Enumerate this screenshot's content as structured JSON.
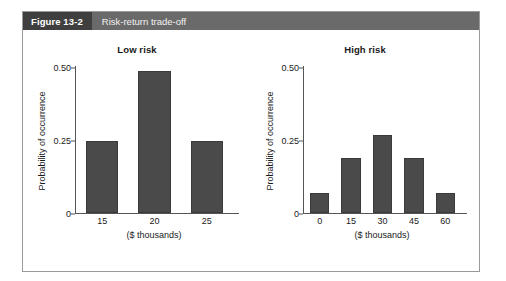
{
  "figure": {
    "number": "Figure 13-2",
    "caption": "Risk-return trade-off",
    "header_bg": "#6a6a6a",
    "number_bg": "#3f3f3f",
    "border_color": "#9a9a9a"
  },
  "chart_data": [
    {
      "type": "bar",
      "title": "Low risk",
      "categories": [
        "15",
        "20",
        "25"
      ],
      "values": [
        0.25,
        0.49,
        0.25
      ],
      "xlabel": "($ thousands)",
      "ylabel": "Probability of occurrence",
      "ylim": [
        0,
        0.5
      ],
      "yticks": [
        0,
        0.25,
        0.5
      ],
      "ytick_labels": [
        "0",
        "0.25",
        "0.50"
      ],
      "grid": false,
      "legend": false,
      "bar_color": "#4a4a4a"
    },
    {
      "type": "bar",
      "title": "High risk",
      "categories": [
        "0",
        "15",
        "30",
        "45",
        "60"
      ],
      "values": [
        0.07,
        0.19,
        0.27,
        0.19,
        0.07
      ],
      "xlabel": "($ thousands)",
      "ylabel": "Probability of occurrence",
      "ylim": [
        0,
        0.5
      ],
      "yticks": [
        0,
        0.25,
        0.5
      ],
      "ytick_labels": [
        "0",
        "0.25",
        "0.50"
      ],
      "grid": false,
      "legend": false,
      "bar_color": "#4a4a4a"
    }
  ]
}
